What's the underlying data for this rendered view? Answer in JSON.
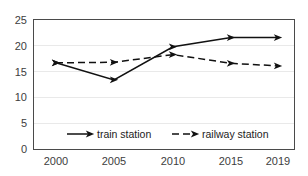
{
  "chart_data": {
    "type": "line",
    "title": "",
    "subtitle": "",
    "xlabel": "",
    "ylabel": "",
    "categories": [
      "2000",
      "2005",
      "2010",
      "2015",
      "2019"
    ],
    "x": [
      2000,
      2005,
      2010,
      2015,
      2019
    ],
    "series": [
      {
        "name": "train station",
        "style": "solid",
        "marker": "arrow",
        "color": "#111111",
        "values": [
          16.7,
          13.4,
          19.8,
          21.6,
          21.6
        ]
      },
      {
        "name": "railway station",
        "style": "dashed",
        "marker": "arrow",
        "color": "#111111",
        "values": [
          16.7,
          16.8,
          18.3,
          16.6,
          16.1
        ]
      }
    ],
    "ylim": [
      0,
      25
    ],
    "yticks": [
      0,
      5,
      10,
      15,
      20,
      25
    ],
    "ytick_labels": [
      "0",
      "5",
      "10",
      "15",
      "20",
      "25"
    ],
    "xtick_labels": [
      "2000",
      "2005",
      "2010",
      "2015",
      "2019"
    ],
    "grid": true,
    "grid_axis": "y",
    "grid_color": "#e9e9e9",
    "legend_position": "inside-bottom-center",
    "background_color": "#ffffff",
    "frame_color": "#4a4a4a"
  },
  "legend": {
    "entries": [
      {
        "label": "train station",
        "style": "solid"
      },
      {
        "label": "railway station",
        "style": "dashed"
      }
    ]
  }
}
